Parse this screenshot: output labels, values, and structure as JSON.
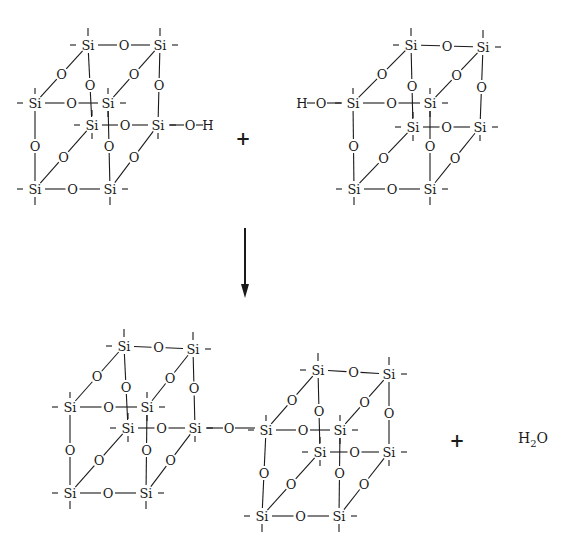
{
  "colors": {
    "ink": "#1a1a1a",
    "background": "#ffffff"
  },
  "labels": {
    "si": "Si",
    "o": "O",
    "h": "H",
    "plus": "+",
    "water_h": "H",
    "water_sub": "2",
    "water_o": "O"
  },
  "reactants": [
    {
      "name": "cube-left-silanol",
      "si": {
        "tbl": [
          88,
          45
        ],
        "tbr": [
          160,
          45
        ],
        "tfl": [
          35,
          103
        ],
        "tfr": [
          108,
          103
        ],
        "bbl": [
          92,
          125
        ],
        "bbr": [
          158,
          125
        ],
        "bfl": [
          35,
          189
        ],
        "bfr": [
          110,
          189
        ]
      },
      "hydroxyl": {
        "from": "bbr",
        "o": [
          190,
          125
        ],
        "h": [
          208,
          125
        ],
        "side": "right"
      }
    },
    {
      "name": "cube-right-silanol",
      "si": {
        "tbl": [
          411,
          45
        ],
        "tbr": [
          483,
          47
        ],
        "tfl": [
          353,
          103
        ],
        "tfr": [
          430,
          103
        ],
        "bbl": [
          413,
          127
        ],
        "bbr": [
          480,
          127
        ],
        "bfl": [
          354,
          189
        ],
        "bfr": [
          430,
          189
        ]
      },
      "hydroxyl": {
        "from": "tfl",
        "o": [
          321,
          103
        ],
        "h": [
          302,
          103
        ],
        "side": "left"
      }
    }
  ],
  "reactant_plus": [
    243,
    139
  ],
  "arrow": {
    "x": 245,
    "y1": 228,
    "y2": 298
  },
  "product": {
    "cubes": [
      {
        "name": "product-cube-left",
        "si": {
          "tbl": [
            124,
            346
          ],
          "tbr": [
            193,
            349
          ],
          "tfl": [
            70,
            407
          ],
          "tfr": [
            147,
            407
          ],
          "bbl": [
            128,
            428
          ],
          "bbr": [
            195,
            428
          ],
          "bfl": [
            70,
            493
          ],
          "bfr": [
            146,
            493
          ]
        }
      },
      {
        "name": "product-cube-right",
        "si": {
          "tbl": [
            318,
            370
          ],
          "tbr": [
            389,
            374
          ],
          "tfl": [
            266,
            430
          ],
          "tfr": [
            340,
            430
          ],
          "bbl": [
            320,
            452
          ],
          "bbr": [
            389,
            452
          ],
          "bfl": [
            262,
            516
          ],
          "bfr": [
            339,
            516
          ]
        }
      }
    ],
    "bridge_oxygen": [
      229,
      428
    ]
  },
  "product_plus": [
    457,
    441
  ],
  "water": {
    "x": 518,
    "y": 438
  }
}
